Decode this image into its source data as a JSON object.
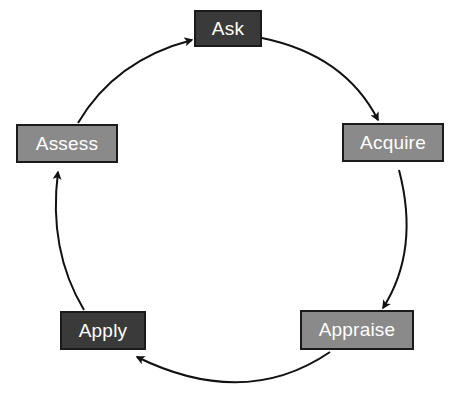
{
  "diagram": {
    "type": "cycle",
    "colors": {
      "dark_fill": "#3a3a3a",
      "light_fill": "#8a8a8a",
      "stroke": "#1a1a1a",
      "text": "#ffffff"
    },
    "nodes": [
      {
        "id": "ask",
        "label": "Ask",
        "fill": "dark"
      },
      {
        "id": "acquire",
        "label": "Acquire",
        "fill": "light"
      },
      {
        "id": "appraise",
        "label": "Appraise",
        "fill": "light"
      },
      {
        "id": "apply",
        "label": "Apply",
        "fill": "dark"
      },
      {
        "id": "assess",
        "label": "Assess",
        "fill": "light"
      }
    ],
    "edges": [
      {
        "from": "Ask",
        "to": "Acquire"
      },
      {
        "from": "Acquire",
        "to": "Appraise"
      },
      {
        "from": "Appraise",
        "to": "Apply"
      },
      {
        "from": "Apply",
        "to": "Assess"
      },
      {
        "from": "Assess",
        "to": "Ask"
      }
    ]
  }
}
